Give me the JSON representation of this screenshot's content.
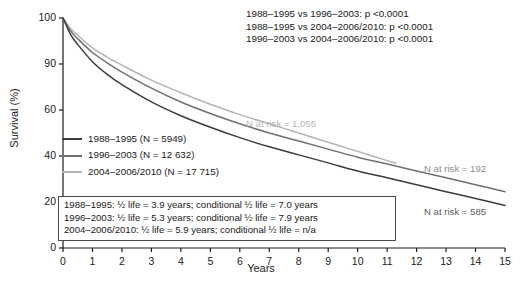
{
  "chart_data": {
    "type": "line",
    "title": "",
    "xlabel": "Years",
    "ylabel": "Survival (%)",
    "xlim": [
      0,
      15
    ],
    "ylim": [
      0,
      100
    ],
    "xticks": [
      "0",
      "1",
      "2",
      "3",
      "4",
      "5",
      "6",
      "7",
      "8",
      "9",
      "10",
      "11",
      "12",
      "13",
      "14",
      "15"
    ],
    "yticks": [
      "100",
      "90",
      "60",
      "40",
      "20",
      "0"
    ],
    "grid": false,
    "legend_position": "inside-left",
    "series": [
      {
        "name": "1988–1995 (N = 5949)",
        "color": "#3c3c3c",
        "x": [
          0,
          0.25,
          0.5,
          1,
          1.5,
          2,
          3,
          4,
          5,
          6,
          7,
          8,
          9,
          10,
          11,
          12,
          13,
          14,
          15
        ],
        "values": [
          100,
          93.0,
          88.5,
          81.0,
          75.5,
          71.0,
          63.5,
          57.5,
          52.5,
          48.0,
          44.0,
          40.5,
          37.0,
          33.5,
          30.5,
          27.5,
          24.5,
          21.5,
          18.5
        ]
      },
      {
        "name": "1996–2003 (N = 12 632)",
        "color": "#707070",
        "x": [
          0,
          0.25,
          0.5,
          1,
          1.5,
          2,
          3,
          4,
          5,
          6,
          7,
          8,
          9,
          10,
          11,
          12,
          13,
          14,
          15
        ],
        "values": [
          100,
          94.5,
          91.0,
          85.0,
          80.5,
          76.5,
          69.5,
          63.5,
          58.5,
          54.0,
          50.0,
          46.5,
          43.0,
          39.5,
          36.5,
          33.5,
          30.5,
          27.5,
          24.5
        ]
      },
      {
        "name": "2004–2006/2010 (N = 17 715)",
        "color": "#b4b4b4",
        "x": [
          0,
          0.25,
          0.5,
          1,
          1.5,
          2,
          3,
          4,
          5,
          6,
          7,
          8,
          9,
          10,
          11,
          11.3
        ],
        "values": [
          100,
          95.5,
          92.5,
          87.0,
          83.0,
          79.5,
          73.0,
          67.5,
          62.5,
          58.0,
          54.0,
          50.0,
          46.0,
          42.0,
          38.0,
          36.8
        ]
      }
    ],
    "annotations": [
      {
        "text": "N at risk = 1,055",
        "color": "#b4b4b4"
      },
      {
        "text": "N at risk = 192",
        "color": "#8c8c8c"
      },
      {
        "text": "N at risk = 585",
        "color": "#5a5a5a"
      }
    ]
  },
  "pvalues": [
    "1988–1995 vs 1996–2003: p <0.0001",
    "1988–1995 vs 2004–2006/2010: p <0.0001",
    "1996–2003 vs 2004–2006/2010: p <0.0001"
  ],
  "legend": [
    {
      "label": "1988–1995 (N = 5949)",
      "color": "#3c3c3c"
    },
    {
      "label": "1996–2003 (N = 12 632)",
      "color": "#707070"
    },
    {
      "label": "2004–2006/2010 (N = 17 715)",
      "color": "#b4b4b4"
    }
  ],
  "summary_box": [
    "1988–1995: ½ life = 3.9 years; conditional ½ life = 7.0 years",
    "1996–2003: ½ life = 5.3 years; conditional ½ life = 7.9 years",
    "2004–2006/2010: ½ life = 5.9 years; conditional ½ life = n/a"
  ],
  "risk_labels": {
    "light": "N at risk = 1,055",
    "mid": "N at risk = 192",
    "dark": "N at risk = 585"
  }
}
